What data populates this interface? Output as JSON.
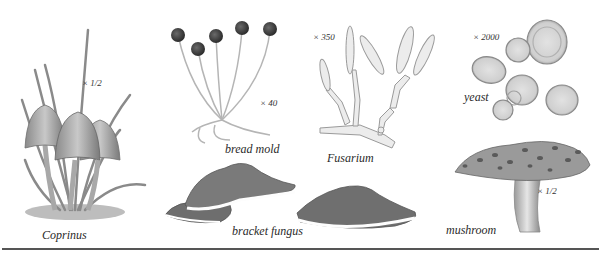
{
  "figure": {
    "specimens": [
      {
        "id": "coprinus",
        "label": "Coprinus",
        "magnification": "× 1/2"
      },
      {
        "id": "bread-mold",
        "label": "bread mold",
        "magnification": "× 40"
      },
      {
        "id": "fusarium",
        "label": "Fusarium",
        "magnification": "× 350"
      },
      {
        "id": "yeast",
        "label": "yeast",
        "magnification": "× 2000"
      },
      {
        "id": "bracket-fungus",
        "label": "bracket fungus",
        "magnification": ""
      },
      {
        "id": "mushroom",
        "label": "mushroom",
        "magnification": "× 1/2"
      }
    ],
    "colors": {
      "background": "#ffffff",
      "ink": "#2a2a2a",
      "rule": "#555555"
    }
  }
}
